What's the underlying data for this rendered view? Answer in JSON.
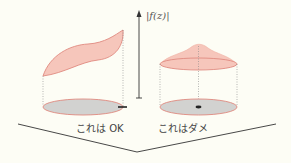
{
  "axis": {
    "label": "|f(z)|"
  },
  "left_case": {
    "caption": "これは OK"
  },
  "right_case": {
    "caption": "これはダメ"
  },
  "colors": {
    "background": "#fdfdf5",
    "surface_fill": "#f6c6bb",
    "surface_stroke": "#e08a80",
    "base_fill": "#d2d2d0",
    "line": "#333333"
  }
}
